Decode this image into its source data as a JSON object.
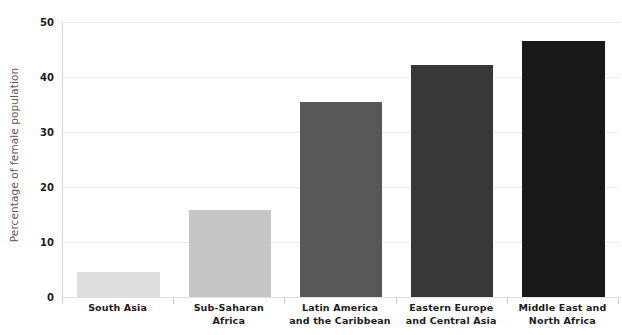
{
  "chart_data": {
    "type": "bar",
    "title": "",
    "subtitle": "",
    "xlabel": "",
    "ylabel": "Percentage of female population",
    "ylim": [
      0,
      50
    ],
    "yticks": [
      0,
      10,
      20,
      30,
      40,
      50
    ],
    "ytick_labels": [
      "0",
      "10",
      "20",
      "30",
      "40",
      "50"
    ],
    "grid": "horizontal",
    "legend": "none",
    "categories": [
      "South Asia",
      "Sub-Saharan Africa",
      "Latin America and the Caribbean",
      "Eastern Europe and Central Asia",
      "Middle East and North Africa"
    ],
    "category_lines": [
      [
        "South Asia",
        ""
      ],
      [
        "Sub-Saharan",
        "Africa"
      ],
      [
        "Latin America",
        "and the Caribbean"
      ],
      [
        "Eastern Europe",
        "and Central Asia"
      ],
      [
        "Middle East and",
        "North Africa"
      ]
    ],
    "values": [
      4.5,
      15.8,
      35.5,
      42.2,
      46.6
    ],
    "bar_colors": [
      "#dedede",
      "#c6c6c6",
      "#585858",
      "#383838",
      "#191919"
    ]
  },
  "axis": {
    "y_title": "Percentage of female population"
  },
  "colors": {
    "gridline": "#eaeaea",
    "axis_line": "#d6d6d6",
    "tick_text": "#1c1c1c",
    "axis_title_text": "#5a5a5a",
    "background": "#ffffff"
  }
}
